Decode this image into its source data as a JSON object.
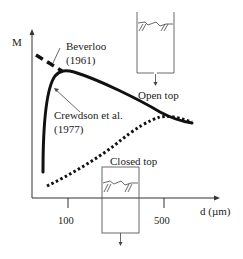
{
  "axes": {
    "y_label": "M",
    "x_label": "d (µm)",
    "x_ticks": [
      {
        "label": "100",
        "value": 100
      },
      {
        "label": "500",
        "value": 500
      }
    ]
  },
  "annotations": {
    "beverloo_line1": "Beverloo",
    "beverloo_line2": "(1961)",
    "crewdson_line1": "Crewdson et al.",
    "crewdson_line2": "(1977)",
    "open_top": "Open top",
    "closed_top": "Closed top"
  },
  "curves": [
    {
      "name": "Beverloo (1961)",
      "style": "dashed",
      "color": "#111111"
    },
    {
      "name": "Crewdson et al. (1977) - open top",
      "style": "solid",
      "color": "#111111"
    },
    {
      "name": "Closed top",
      "style": "dotted",
      "color": "#111111"
    }
  ]
}
